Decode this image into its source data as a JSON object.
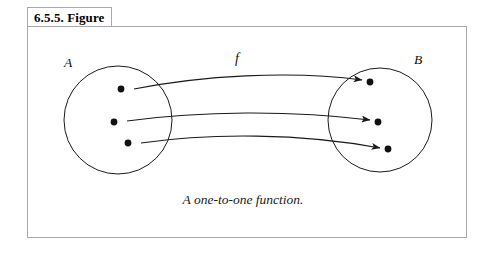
{
  "figure": {
    "title": "6.5.5. Figure",
    "caption": "A one-to-one function.",
    "border_color": "#a9a9a9",
    "ink_color": "#1a1a1a",
    "background": "#ffffff"
  },
  "diagram": {
    "type": "mapping-diagram",
    "domain_label": "A",
    "codomain_label": "B",
    "function_label": "f",
    "domain": {
      "label": "A",
      "center_x": 118,
      "center_y": 120,
      "radius": 54,
      "elements": [
        {
          "id": "a1",
          "x": 121,
          "y": 89
        },
        {
          "id": "a2",
          "x": 114,
          "y": 122
        },
        {
          "id": "a3",
          "x": 128,
          "y": 143
        }
      ]
    },
    "codomain": {
      "label": "B",
      "center_x": 380,
      "center_y": 120,
      "radius": 52,
      "elements": [
        {
          "id": "b1",
          "x": 370,
          "y": 82
        },
        {
          "id": "b2",
          "x": 378,
          "y": 122
        },
        {
          "id": "b3",
          "x": 388,
          "y": 149
        }
      ]
    },
    "mappings": [
      {
        "from": "a1",
        "to": "b1"
      },
      {
        "from": "a2",
        "to": "b2"
      },
      {
        "from": "a3",
        "to": "b3"
      }
    ]
  }
}
